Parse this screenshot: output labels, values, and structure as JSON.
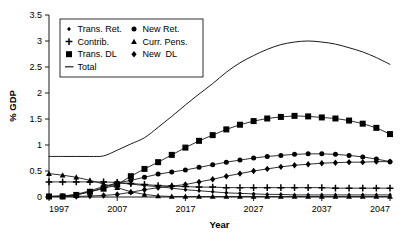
{
  "chart_data": {
    "type": "line",
    "title": "",
    "xlabel": "Year",
    "ylabel": "% GDP",
    "xlim": [
      1997,
      2047
    ],
    "ylim": [
      0,
      3.5
    ],
    "xticks": [
      1997,
      2007,
      2017,
      2027,
      2037,
      2047
    ],
    "xtick_labels": [
      "1997",
      "2007",
      "2017",
      "2027",
      "2037",
      "2047"
    ],
    "yticks": [
      0,
      0.5,
      1,
      1.5,
      2,
      2.5,
      3,
      3.5
    ],
    "ytick_labels": [
      "0",
      "0.5",
      "1",
      "1.5",
      "2",
      "2.5",
      "3",
      "3.5"
    ],
    "grid": false,
    "legend_position": "upper-left",
    "legend_columns": 2,
    "x": [
      1997,
      1999,
      2001,
      2003,
      2005,
      2007,
      2009,
      2011,
      2013,
      2015,
      2017,
      2019,
      2021,
      2023,
      2025,
      2027,
      2029,
      2031,
      2033,
      2035,
      2037,
      2039,
      2041,
      2043,
      2045,
      2047
    ],
    "series": [
      {
        "name": "Trans. Ret.",
        "marker": "diamond-small",
        "values": [
          0.01,
          0.02,
          0.05,
          0.12,
          0.2,
          0.27,
          0.25,
          0.22,
          0.2,
          0.17,
          0.14,
          0.12,
          0.1,
          0.08,
          0.07,
          0.06,
          0.05,
          0.05,
          0.04,
          0.04,
          0.04,
          0.04,
          0.04,
          0.04,
          0.04,
          0.04
        ]
      },
      {
        "name": "Contrib.",
        "marker": "plus",
        "values": [
          0.29,
          0.29,
          0.29,
          0.29,
          0.29,
          0.28,
          0.26,
          0.24,
          0.22,
          0.21,
          0.2,
          0.19,
          0.19,
          0.18,
          0.18,
          0.18,
          0.18,
          0.18,
          0.18,
          0.18,
          0.18,
          0.17,
          0.17,
          0.17,
          0.17,
          0.17
        ]
      },
      {
        "name": "Trans. DL",
        "marker": "square",
        "values": [
          0.01,
          0.01,
          0.04,
          0.1,
          0.16,
          0.24,
          0.4,
          0.54,
          0.67,
          0.81,
          0.95,
          1.08,
          1.19,
          1.3,
          1.39,
          1.46,
          1.51,
          1.54,
          1.56,
          1.55,
          1.53,
          1.51,
          1.47,
          1.41,
          1.33,
          1.21
        ]
      },
      {
        "name": "Total",
        "marker": "none",
        "values": [
          0.78,
          0.78,
          0.78,
          0.78,
          0.79,
          0.9,
          1.02,
          1.14,
          1.34,
          1.55,
          1.77,
          1.98,
          2.18,
          2.4,
          2.58,
          2.72,
          2.84,
          2.93,
          2.98,
          3.0,
          2.98,
          2.94,
          2.87,
          2.79,
          2.68,
          2.55
        ]
      },
      {
        "name": "New Ret.",
        "marker": "circle",
        "values": [
          0.01,
          0.02,
          0.04,
          0.1,
          0.18,
          0.27,
          0.32,
          0.38,
          0.44,
          0.48,
          0.52,
          0.57,
          0.62,
          0.67,
          0.71,
          0.75,
          0.78,
          0.8,
          0.82,
          0.83,
          0.83,
          0.82,
          0.8,
          0.77,
          0.73,
          0.68
        ]
      },
      {
        "name": "Curr. Pens.",
        "marker": "triangle",
        "values": [
          0.45,
          0.42,
          0.38,
          0.32,
          0.25,
          0.18,
          0.1,
          0.05,
          0.02,
          0.01,
          0.01,
          0.01,
          0.01,
          0.01,
          0.01,
          0.01,
          0.01,
          0.01,
          0.01,
          0.01,
          0.01,
          0.01,
          0.01,
          0.01,
          0.01,
          0.01
        ]
      },
      {
        "name": "New  DL",
        "marker": "diamond",
        "values": [
          0.01,
          0.01,
          0.01,
          0.02,
          0.03,
          0.05,
          0.09,
          0.14,
          0.18,
          0.21,
          0.24,
          0.29,
          0.34,
          0.4,
          0.45,
          0.5,
          0.54,
          0.58,
          0.61,
          0.63,
          0.65,
          0.66,
          0.67,
          0.67,
          0.68,
          0.68
        ]
      }
    ],
    "legend_entries": [
      {
        "label": "Trans. Ret.",
        "marker": "diamond-small",
        "column": 0,
        "row": 0
      },
      {
        "label": "Contrib.",
        "marker": "plus",
        "column": 0,
        "row": 1
      },
      {
        "label": "Trans. DL",
        "marker": "square",
        "column": 0,
        "row": 2
      },
      {
        "label": "Total",
        "marker": "line",
        "column": 0,
        "row": 3
      },
      {
        "label": "New Ret.",
        "marker": "circle",
        "column": 1,
        "row": 0
      },
      {
        "label": "Curr. Pens.",
        "marker": "triangle",
        "column": 1,
        "row": 1
      },
      {
        "label": "New  DL",
        "marker": "diamond",
        "column": 1,
        "row": 2
      }
    ],
    "colors": {
      "ink": "#1a1a1a",
      "background": "#ffffff"
    }
  }
}
